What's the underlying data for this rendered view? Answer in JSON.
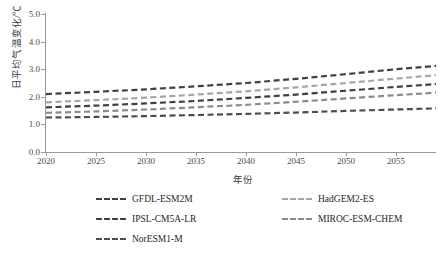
{
  "chart_data": {
    "type": "line",
    "title": "",
    "xlabel": "年份",
    "ylabel": "日平均气温变化/℃",
    "xlim": [
      2020,
      2059
    ],
    "ylim": [
      0.0,
      5.0
    ],
    "grid": false,
    "legend_position": "bottom",
    "xticks": [
      2020,
      2025,
      2030,
      2035,
      2040,
      2045,
      2050,
      2055
    ],
    "xtick_labels": [
      "2020",
      "2025",
      "2030",
      "2035",
      "2040",
      "2045",
      "2050",
      "2055"
    ],
    "yticks": [
      0.0,
      1.0,
      2.0,
      3.0,
      4.0,
      5.0
    ],
    "ytick_labels": [
      "0.0",
      "1.0",
      "2.0",
      "3.0",
      "4.0",
      "5.0"
    ],
    "x": [
      2020,
      2025,
      2030,
      2035,
      2040,
      2045,
      2050,
      2055,
      2059
    ],
    "series": [
      {
        "name": "GFDL-ESM2M",
        "color": "#404040",
        "values": [
          2.1,
          2.18,
          2.27,
          2.38,
          2.5,
          2.65,
          2.82,
          3.0,
          3.12
        ]
      },
      {
        "name": "HadGEM2-ES",
        "color": "#a6a6a6",
        "values": [
          1.8,
          1.88,
          1.97,
          2.08,
          2.2,
          2.34,
          2.5,
          2.66,
          2.78
        ]
      },
      {
        "name": "IPSL-CM5A-LR",
        "color": "#404040",
        "values": [
          1.62,
          1.68,
          1.76,
          1.85,
          1.96,
          2.08,
          2.22,
          2.36,
          2.46
        ]
      },
      {
        "name": "MIROC-ESM-CHEM",
        "color": "#8c8c8c",
        "values": [
          1.42,
          1.47,
          1.54,
          1.62,
          1.71,
          1.82,
          1.94,
          2.06,
          2.15
        ]
      },
      {
        "name": "NorESM1-M",
        "color": "#4d4d4d",
        "values": [
          1.25,
          1.27,
          1.3,
          1.34,
          1.38,
          1.43,
          1.49,
          1.54,
          1.58
        ]
      }
    ]
  },
  "legend": {
    "items": [
      {
        "label": "GFDL-ESM2M",
        "color": "#404040"
      },
      {
        "label": "HadGEM2-ES",
        "color": "#a6a6a6"
      },
      {
        "label": "IPSL-CM5A-LR",
        "color": "#404040"
      },
      {
        "label": "MIROC-ESM-CHEM",
        "color": "#8c8c8c"
      },
      {
        "label": "NorESM1-M",
        "color": "#4d4d4d"
      }
    ]
  }
}
